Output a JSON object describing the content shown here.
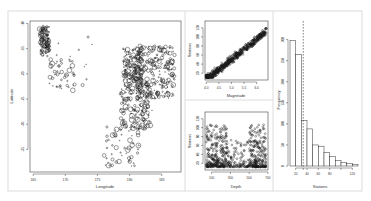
{
  "figure": {
    "background": "#ffffff",
    "frame_color": "#d8d8d8",
    "ink_color": "#1a1a1a"
  },
  "chart_data": [
    {
      "id": "map",
      "type": "scatter",
      "title": "",
      "xlabel": "Longitude",
      "ylabel": "Latitude",
      "xlim": [
        164.5,
        188
      ],
      "ylim": [
        -39.5,
        -9.5
      ],
      "xticks": [
        165,
        170,
        175,
        180,
        185
      ],
      "yticks": [
        -10,
        -15,
        -20,
        -25,
        -30,
        -35
      ],
      "grid": false,
      "marker": "open-circle sized by magnitude",
      "clusters": [
        {
          "x": [
            166.0,
            167.5
          ],
          "y": [
            -10.5,
            -16.5
          ],
          "n": 110
        },
        {
          "x": [
            167.5,
            171.5
          ],
          "y": [
            -17.0,
            -23.5
          ],
          "n": 45
        },
        {
          "x": [
            168.5,
            174.5
          ],
          "y": [
            -12.5,
            -23.0
          ],
          "n": 14
        },
        {
          "x": [
            179.0,
            182.0
          ],
          "y": [
            -15.0,
            -23.0
          ],
          "n": 170
        },
        {
          "x": [
            181.0,
            187.0
          ],
          "y": [
            -14.5,
            -25.0
          ],
          "n": 260
        },
        {
          "x": [
            178.5,
            183.5
          ],
          "y": [
            -23.0,
            -31.0
          ],
          "n": 150
        },
        {
          "x": [
            176.0,
            181.5
          ],
          "y": [
            -30.0,
            -38.5
          ],
          "n": 60
        }
      ]
    },
    {
      "id": "magnitude-vs-stations",
      "type": "scatter",
      "title": "",
      "xlabel": "Magnitude",
      "ylabel": "Stations",
      "xlim": [
        3.95,
        6.45
      ],
      "ylim": [
        5,
        135
      ],
      "xticks": [
        4.0,
        4.5,
        5.0,
        5.5,
        6.0
      ],
      "yticks": [
        20,
        40,
        60,
        80,
        100,
        120
      ],
      "grid": false,
      "relationship": "stations ≈ 45·mag − 175 (positive linear)",
      "n": 1000
    },
    {
      "id": "depth-vs-stations",
      "type": "scatter",
      "title": "",
      "xlabel": "Depth",
      "ylabel": "Stations",
      "xlim": [
        30,
        700
      ],
      "ylim": [
        5,
        135
      ],
      "xticks": [
        100,
        300,
        500,
        700
      ],
      "yticks": [
        20,
        40,
        60,
        80,
        100,
        120
      ],
      "grid": false,
      "n": 1000
    },
    {
      "id": "stations-histogram",
      "type": "bar",
      "title": "",
      "xlabel": "Stations",
      "ylabel": "Frequency",
      "bins": [
        10,
        20,
        30,
        40,
        50,
        60,
        70,
        80,
        90,
        100,
        110,
        120,
        130
      ],
      "categories": [
        "10-20",
        "20-30",
        "30-40",
        "40-50",
        "50-60",
        "60-70",
        "70-80",
        "80-90",
        "90-100",
        "100-110",
        "110-120",
        "120-130"
      ],
      "values": [
        298,
        265,
        108,
        88,
        50,
        47,
        32,
        22,
        13,
        8,
        6,
        3
      ],
      "mean_line": 33.4,
      "xticks": [
        20,
        40,
        60,
        80,
        100,
        120
      ],
      "xtick_labels": [
        "20",
        "40",
        "60",
        "80",
        "",
        "120"
      ],
      "yticks": [
        0,
        50,
        100,
        150,
        200,
        250,
        300
      ],
      "ylim": [
        0,
        330
      ],
      "grid": false
    }
  ]
}
